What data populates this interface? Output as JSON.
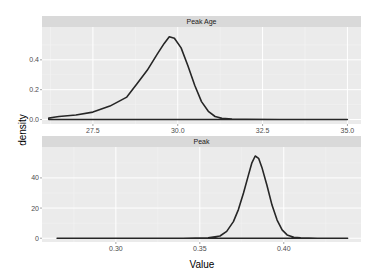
{
  "chart_data": [
    {
      "type": "line",
      "title": "Peak Age",
      "xlabel": "Value",
      "ylabel": "density",
      "xlim": [
        26.0,
        35.4
      ],
      "ylim": [
        -0.03,
        0.62
      ],
      "x_ticks": [
        27.5,
        30.0,
        32.5,
        35.0
      ],
      "x_tick_labels": [
        "27.5",
        "30.0",
        "32.5",
        "35.0"
      ],
      "y_ticks": [
        0.0,
        0.2,
        0.4
      ],
      "y_tick_labels": [
        "0.0",
        "0.2",
        "0.4"
      ],
      "grid": true,
      "series": [
        {
          "name": "density",
          "x": [
            26.2,
            26.5,
            27.0,
            27.5,
            28.0,
            28.5,
            28.8,
            29.1,
            29.4,
            29.6,
            29.75,
            29.9,
            30.1,
            30.3,
            30.5,
            30.7,
            30.9,
            31.1,
            31.3,
            31.6,
            32.0,
            33.0,
            34.0,
            35.0
          ],
          "y": [
            0.01,
            0.02,
            0.03,
            0.05,
            0.09,
            0.15,
            0.24,
            0.33,
            0.44,
            0.51,
            0.555,
            0.545,
            0.48,
            0.36,
            0.23,
            0.12,
            0.055,
            0.02,
            0.008,
            0.003,
            0.001,
            0.0,
            0.0,
            0.0
          ]
        }
      ]
    },
    {
      "type": "line",
      "title": "Peak",
      "xlabel": "Value",
      "ylabel": "density",
      "xlim": [
        0.256,
        0.446
      ],
      "ylim": [
        -2.5,
        60.5
      ],
      "x_ticks": [
        0.3,
        0.35,
        0.4
      ],
      "x_tick_labels": [
        "0.30",
        "0.35",
        "0.40"
      ],
      "y_ticks": [
        0,
        20,
        40
      ],
      "y_tick_labels": [
        "0",
        "20",
        "40"
      ],
      "grid": true,
      "series": [
        {
          "name": "density",
          "x": [
            0.265,
            0.3,
            0.34,
            0.355,
            0.362,
            0.366,
            0.37,
            0.373,
            0.376,
            0.379,
            0.381,
            0.383,
            0.385,
            0.387,
            0.39,
            0.393,
            0.396,
            0.399,
            0.402,
            0.406,
            0.41,
            0.42,
            0.438
          ],
          "y": [
            0.0,
            0.0,
            0.0,
            0.2,
            1.5,
            4.5,
            11,
            19,
            30,
            42,
            50,
            54.5,
            53,
            47,
            35,
            22,
            12,
            5.5,
            2.2,
            0.6,
            0.2,
            0.0,
            0.0
          ]
        }
      ]
    }
  ],
  "labels": {
    "ylabel": "density",
    "xlabel": "Value",
    "panel1_strip": "Peak Age",
    "panel2_strip": "Peak"
  },
  "colors": {
    "panel_bg": "#ebebeb",
    "strip_bg": "#d9d9d9",
    "grid_major": "#ffffff",
    "line": "#262626"
  }
}
